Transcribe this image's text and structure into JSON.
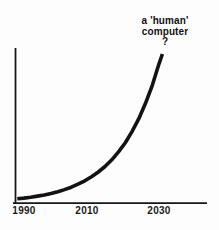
{
  "figure": {
    "background": "#fdfdfd",
    "ink": "#121212"
  },
  "annotation": {
    "line1": "a 'human'",
    "line2": "computer",
    "line3": "?"
  },
  "chart_data": {
    "type": "line",
    "title": "",
    "xlabel": "",
    "ylabel": "",
    "x_tick_labels": [
      "1990",
      "2010",
      "2030"
    ],
    "x_range": [
      1987,
      2044
    ],
    "ylim": [
      0,
      1.05
    ],
    "y_axis_labeled": false,
    "grid": false,
    "legend": "none",
    "annotation_text": "a 'human' computer ?",
    "annotation_year": 2031,
    "line_color": "#121212",
    "series": [
      {
        "name": "exponential growth toward a 'human' computer",
        "points": [
          [
            1988,
            0.028
          ],
          [
            1990,
            0.033
          ],
          [
            1992,
            0.039
          ],
          [
            1994,
            0.046
          ],
          [
            1996,
            0.054
          ],
          [
            1998,
            0.064
          ],
          [
            2000,
            0.076
          ],
          [
            2002,
            0.09
          ],
          [
            2004,
            0.106
          ],
          [
            2006,
            0.126
          ],
          [
            2008,
            0.149
          ],
          [
            2010,
            0.176
          ],
          [
            2012,
            0.208
          ],
          [
            2014,
            0.245
          ],
          [
            2016,
            0.29
          ],
          [
            2018,
            0.343
          ],
          [
            2020,
            0.405
          ],
          [
            2022,
            0.479
          ],
          [
            2024,
            0.566
          ],
          [
            2026,
            0.669
          ],
          [
            2028,
            0.79
          ],
          [
            2030,
            0.934
          ],
          [
            2031,
            1.0
          ]
        ]
      }
    ]
  }
}
